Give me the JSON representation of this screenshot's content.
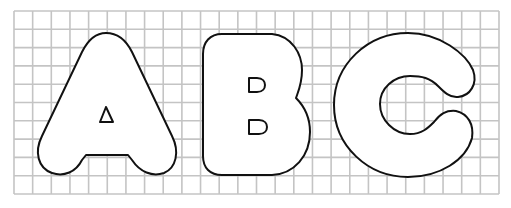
{
  "title": "Bubble letters A B C on grid paper",
  "grid": {
    "left": 14,
    "top": 11,
    "right": 499,
    "bottom": 194,
    "columns": 26,
    "rows": 10,
    "line_color": "#c4c4c4"
  },
  "letters": [
    {
      "char": "A",
      "label": "Letter A outline"
    },
    {
      "char": "B",
      "label": "Letter B outline"
    },
    {
      "char": "C",
      "label": "Letter C outline"
    }
  ],
  "colors": {
    "outline": "#111111",
    "paper": "#ffffff"
  }
}
